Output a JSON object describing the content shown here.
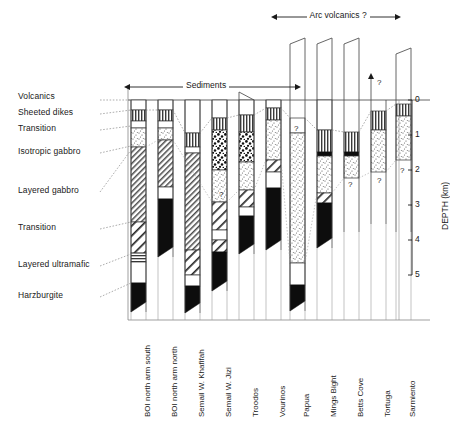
{
  "figure": {
    "brackets": [
      {
        "name": "sediments",
        "label": "Sediments",
        "x1": 130,
        "x2": 296,
        "y": 87
      },
      {
        "name": "arc-volcanics",
        "label": "Arc volcanics ?",
        "x1": 277,
        "x2": 396,
        "y": 17
      }
    ],
    "unit_labels": [
      {
        "key": "volcanics",
        "label": "Volcanics",
        "x": 18,
        "y": 97
      },
      {
        "key": "sheeted-dikes",
        "label": "Sheeted dikes",
        "x": 18,
        "y": 113
      },
      {
        "key": "transition-upper",
        "label": "Transition",
        "x": 18,
        "y": 129
      },
      {
        "key": "isotropic-gabbro",
        "label": "Isotropic gabbro",
        "x": 18,
        "y": 152
      },
      {
        "key": "layered-gabbro",
        "label": "Layered gabbro",
        "x": 18,
        "y": 191
      },
      {
        "key": "transition-lower",
        "label": "Transition",
        "x": 18,
        "y": 228
      },
      {
        "key": "layered-ultramafic",
        "label": "Layered ultramafic",
        "x": 18,
        "y": 265
      },
      {
        "key": "harzburgite",
        "label": "Harzburgite",
        "x": 18,
        "y": 296
      }
    ],
    "depth_axis": {
      "title": "DEPTH (km)",
      "unit": "km",
      "ticks": [
        "0",
        "1",
        "2",
        "3",
        "4",
        "5"
      ],
      "min": 0,
      "max": 5,
      "x": 412,
      "y_top": 100,
      "y_bottom": 275
    },
    "columns": [
      {
        "name": "boi-north-arm-south",
        "label": "BOI north arm south",
        "x": 131,
        "width": 15,
        "top_extension": 0,
        "top_style": "flat",
        "bottom_y": 312,
        "bottom_style": "wedge",
        "layers": [
          {
            "unit": "volcanics",
            "pattern": "blank",
            "from": 100,
            "to": 110
          },
          {
            "unit": "sheeted-dikes",
            "pattern": "vertical",
            "from": 110,
            "to": 121
          },
          {
            "unit": "transition",
            "pattern": "blank",
            "from": 121,
            "to": 128
          },
          {
            "unit": "isotropic-gabbro",
            "pattern": "stipple",
            "from": 128,
            "to": 147
          },
          {
            "unit": "layered-gabbro",
            "pattern": "diagonal-fine",
            "from": 147,
            "to": 222
          },
          {
            "unit": "transition",
            "pattern": "diagonal-coarse",
            "from": 222,
            "to": 253
          },
          {
            "unit": "layered-ultramafic-band",
            "pattern": "horizontal",
            "from": 253,
            "to": 262
          },
          {
            "unit": "layered-ultramafic",
            "pattern": "blank",
            "from": 262,
            "to": 283
          },
          {
            "unit": "harzburgite",
            "pattern": "solid",
            "from": 283,
            "to": 312
          }
        ]
      },
      {
        "name": "boi-north-arm-north",
        "label": "BOI north arm north",
        "x": 158,
        "width": 15,
        "top_extension": 0,
        "top_style": "flat",
        "bottom_y": 257,
        "bottom_style": "wedge",
        "layers": [
          {
            "unit": "volcanics",
            "pattern": "blank",
            "from": 100,
            "to": 110
          },
          {
            "unit": "sheeted-dikes",
            "pattern": "vertical",
            "from": 110,
            "to": 121
          },
          {
            "unit": "transition",
            "pattern": "blank",
            "from": 121,
            "to": 128
          },
          {
            "unit": "isotropic-gabbro",
            "pattern": "stipple",
            "from": 128,
            "to": 140
          },
          {
            "unit": "layered-gabbro",
            "pattern": "diagonal-fine",
            "from": 140,
            "to": 187
          },
          {
            "unit": "layered-ultramafic",
            "pattern": "blank",
            "from": 187,
            "to": 199
          },
          {
            "unit": "harzburgite",
            "pattern": "solid",
            "from": 199,
            "to": 257
          }
        ]
      },
      {
        "name": "semail-w-khafifah",
        "label": "Semail W. Khafifah",
        "x": 185,
        "width": 15,
        "top_extension": 0,
        "top_style": "flat",
        "bottom_y": 313,
        "bottom_style": "wedge",
        "layers": [
          {
            "unit": "volcanics",
            "pattern": "blank",
            "from": 100,
            "to": 133
          },
          {
            "unit": "sheeted-dikes",
            "pattern": "vertical",
            "from": 133,
            "to": 147
          },
          {
            "unit": "transition",
            "pattern": "blank",
            "from": 147,
            "to": 153
          },
          {
            "unit": "layered-gabbro",
            "pattern": "diagonal-fine",
            "from": 153,
            "to": 250
          },
          {
            "unit": "transition",
            "pattern": "diagonal-coarse",
            "from": 250,
            "to": 275
          },
          {
            "unit": "layered-ultramafic",
            "pattern": "blank",
            "from": 275,
            "to": 286
          },
          {
            "unit": "harzburgite",
            "pattern": "solid",
            "from": 286,
            "to": 313
          }
        ]
      },
      {
        "name": "semail-w-jizi",
        "label": "Semail W. Jizi",
        "x": 212,
        "width": 15,
        "top_extension": 0,
        "top_style": "flat",
        "bottom_y": 291,
        "bottom_style": "wedge",
        "layers": [
          {
            "unit": "volcanics",
            "pattern": "blank",
            "from": 100,
            "to": 118
          },
          {
            "unit": "sheeted-dikes",
            "pattern": "vertical",
            "from": 118,
            "to": 130
          },
          {
            "unit": "isotropic-gabbro",
            "pattern": "speckle",
            "from": 130,
            "to": 170
          },
          {
            "unit": "layered-gabbro",
            "pattern": "stipple",
            "from": 170,
            "to": 202
          },
          {
            "unit": "layered-gabbro-2",
            "pattern": "diagonal-coarse",
            "from": 202,
            "to": 230
          },
          {
            "unit": "layered-ultramafic",
            "pattern": "blank",
            "from": 230,
            "to": 240
          },
          {
            "unit": "transition",
            "pattern": "diagonal-coarse",
            "from": 240,
            "to": 252
          },
          {
            "unit": "harzburgite",
            "pattern": "solid",
            "from": 252,
            "to": 291
          }
        ]
      },
      {
        "name": "troodos",
        "label": "Troodos",
        "x": 239,
        "width": 15,
        "top_extension": 0,
        "top_style": "slant-left",
        "bottom_y": 254,
        "bottom_style": "wedge",
        "layers": [
          {
            "unit": "volcanics",
            "pattern": "blank",
            "from": 100,
            "to": 115
          },
          {
            "unit": "sheeted-dikes",
            "pattern": "vertical",
            "from": 115,
            "to": 132
          },
          {
            "unit": "isotropic-gabbro",
            "pattern": "speckle",
            "from": 132,
            "to": 162
          },
          {
            "unit": "layered-gabbro",
            "pattern": "stipple",
            "from": 162,
            "to": 190
          },
          {
            "unit": "transition",
            "pattern": "diagonal-coarse",
            "from": 190,
            "to": 207
          },
          {
            "unit": "layered-ultramafic",
            "pattern": "blank",
            "from": 207,
            "to": 216
          },
          {
            "unit": "harzburgite",
            "pattern": "solid",
            "from": 216,
            "to": 254
          }
        ]
      },
      {
        "name": "vourinos",
        "label": "Vourinos",
        "x": 266,
        "width": 15,
        "top_extension": 0,
        "top_style": "flat",
        "bottom_y": 250,
        "bottom_style": "wedge",
        "layers": [
          {
            "unit": "volcanics",
            "pattern": "blank",
            "from": 100,
            "to": 108
          },
          {
            "unit": "sheeted-dikes",
            "pattern": "vertical",
            "from": 108,
            "to": 120
          },
          {
            "unit": "isotropic-gabbro",
            "pattern": "stipple",
            "from": 120,
            "to": 160
          },
          {
            "unit": "transition",
            "pattern": "diagonal-coarse",
            "from": 160,
            "to": 172
          },
          {
            "unit": "layered-ultramafic",
            "pattern": "blank",
            "from": 172,
            "to": 188
          },
          {
            "unit": "harzburgite",
            "pattern": "solid",
            "from": 188,
            "to": 250
          }
        ]
      },
      {
        "name": "papua",
        "label": "Papua",
        "x": 290,
        "width": 15,
        "top_extension": 62,
        "top_style": "slant-right",
        "bottom_y": 311,
        "bottom_style": "wedge",
        "layers": [
          {
            "unit": "sheeted-dikes",
            "pattern": "question",
            "from": 118,
            "to": 133,
            "marker": "?"
          },
          {
            "unit": "layered-gabbro",
            "pattern": "stipple",
            "from": 133,
            "to": 263
          },
          {
            "unit": "layered-ultramafic",
            "pattern": "blank",
            "from": 263,
            "to": 285
          },
          {
            "unit": "harzburgite",
            "pattern": "solid",
            "from": 285,
            "to": 311
          }
        ]
      },
      {
        "name": "mings-bight",
        "label": "Mings Bight",
        "x": 317,
        "width": 15,
        "top_extension": 62,
        "top_style": "slant-right",
        "bottom_y": 248,
        "bottom_style": "wedge",
        "layers": [
          {
            "unit": "volcanics",
            "pattern": "blank",
            "from": 100,
            "to": 130
          },
          {
            "unit": "sheeted-dikes",
            "pattern": "vertical",
            "from": 130,
            "to": 152
          },
          {
            "unit": "transition",
            "pattern": "solid-thin",
            "from": 152,
            "to": 156
          },
          {
            "unit": "isotropic-gabbro",
            "pattern": "stipple",
            "from": 156,
            "to": 193
          },
          {
            "unit": "transition",
            "pattern": "diagonal-coarse",
            "from": 193,
            "to": 203
          },
          {
            "unit": "harzburgite",
            "pattern": "solid",
            "from": 203,
            "to": 248
          }
        ]
      },
      {
        "name": "betts-cove",
        "label": "Betts Cove",
        "x": 344,
        "width": 15,
        "top_extension": 62,
        "top_style": "slant-right",
        "bottom_y": 232,
        "bottom_style": "flat",
        "layers": [
          {
            "unit": "sheeted-dikes",
            "pattern": "vertical",
            "from": 132,
            "to": 152
          },
          {
            "unit": "transition",
            "pattern": "solid-thin",
            "from": 152,
            "to": 156
          },
          {
            "unit": "isotropic-gabbro",
            "pattern": "stipple",
            "from": 156,
            "to": 178,
            "marker": "?"
          }
        ]
      },
      {
        "name": "tortuga",
        "label": "Tortuga",
        "x": 371,
        "width": 15,
        "top_extension": 22,
        "top_style": "arrow",
        "bottom_y": 224,
        "bottom_style": "flat",
        "layers": [
          {
            "unit": "sheeted-dikes",
            "pattern": "vertical",
            "from": 111,
            "to": 130
          },
          {
            "unit": "isotropic-gabbro",
            "pattern": "stipple",
            "from": 130,
            "to": 172,
            "marker": "?"
          }
        ]
      },
      {
        "name": "sarmiento",
        "label": "Sarmiento",
        "x": 396,
        "width": 15,
        "top_extension": 52,
        "top_style": "slant-right",
        "bottom_y": 232,
        "bottom_style": "flat",
        "layers": [
          {
            "unit": "sheeted-dikes",
            "pattern": "vertical",
            "from": 104,
            "to": 116
          },
          {
            "unit": "isotropic-gabbro",
            "pattern": "stipple",
            "from": 116,
            "to": 160,
            "marker": "?"
          }
        ]
      }
    ],
    "question_marks": [
      {
        "name": "papua-dike-q",
        "x": 294,
        "y": 130
      },
      {
        "name": "betts-cove-q",
        "x": 348,
        "y": 186
      },
      {
        "name": "tortuga-q",
        "x": 377,
        "y": 182
      },
      {
        "name": "sarmiento-q",
        "x": 400,
        "y": 172
      },
      {
        "name": "top-arrow-q",
        "x": 377,
        "y": 84
      },
      {
        "name": "jizi-q",
        "x": 219,
        "y": 196
      }
    ]
  }
}
